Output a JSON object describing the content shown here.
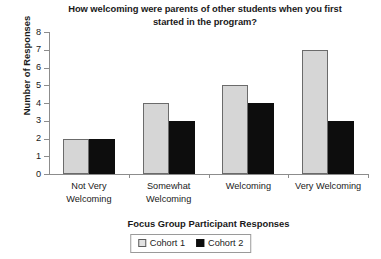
{
  "chart_data": {
    "type": "bar",
    "title": "How welcoming were parents of other students when you first started in the program?",
    "title_lines": [
      "How welcoming were parents of other students when you first",
      "started in the program?"
    ],
    "xlabel": "Focus Group Participant Responses",
    "ylabel": "Number of Responses",
    "categories": [
      "Not Very Welcoming",
      "Somewhat Welcoming",
      "Welcoming",
      "Very Welcoming"
    ],
    "category_lines": [
      [
        "Not Very",
        "Welcoming"
      ],
      [
        "Somewhat",
        "Welcoming"
      ],
      [
        "Welcoming"
      ],
      [
        "Very Welcoming"
      ]
    ],
    "series": [
      {
        "name": "Cohort 1",
        "values": [
          2,
          4,
          5,
          7
        ],
        "color": "#d6d6d6"
      },
      {
        "name": "Cohort 2",
        "values": [
          2,
          3,
          4,
          3
        ],
        "color": "#0d0d0d"
      }
    ],
    "ylim": [
      0,
      8
    ],
    "yticks": [
      0,
      1,
      2,
      3,
      4,
      5,
      6,
      7,
      8
    ],
    "ytick_labels": [
      "0",
      "1",
      "2",
      "3",
      "4",
      "5",
      "6",
      "7",
      "8"
    ],
    "grid": false,
    "legend_position": "bottom"
  }
}
